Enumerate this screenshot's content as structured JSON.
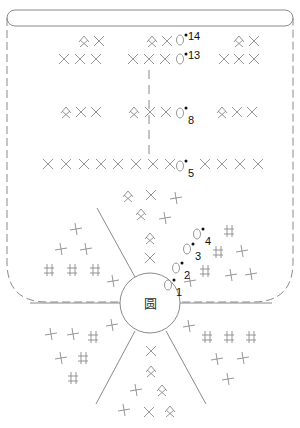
{
  "title": "",
  "center": {
    "label": "圆",
    "x": 150,
    "y": 303,
    "r": 30
  },
  "colors": {
    "line": "#8a8a8a",
    "dark_line": "#555555",
    "text": "#111111",
    "background": "#ffffff"
  },
  "outline": {
    "x": 7,
    "y": 10,
    "w": 286,
    "h": 292,
    "top_band_h": 16
  },
  "round_labels": [
    {
      "text": "14",
      "x": 184,
      "y": 40,
      "circle_x": 180,
      "circle_y": 40
    },
    {
      "text": "13",
      "x": 184,
      "y": 59,
      "circle_x": 180,
      "circle_y": 59
    },
    {
      "text": "8",
      "x": 184,
      "y": 118,
      "circle_x": 180,
      "circle_y": 113
    },
    {
      "text": "5",
      "x": 184,
      "y": 171,
      "circle_x": 180,
      "circle_y": 166
    },
    {
      "text": "4",
      "x": 201,
      "y": 239,
      "circle_x": 197,
      "circle_y": 234
    },
    {
      "text": "3",
      "x": 191,
      "y": 254,
      "circle_x": 187,
      "circle_y": 249
    },
    {
      "text": "2",
      "x": 180,
      "y": 273,
      "circle_x": 176,
      "circle_y": 268
    },
    {
      "text": "1",
      "x": 172,
      "y": 290,
      "circle_x": 168,
      "circle_y": 285
    }
  ],
  "symbols": [
    {
      "t": "kite",
      "x": 84,
      "y": 41
    },
    {
      "t": "x",
      "x": 99,
      "y": 41
    },
    {
      "t": "kite",
      "x": 152,
      "y": 41
    },
    {
      "t": "x",
      "x": 167,
      "y": 41
    },
    {
      "t": "kite",
      "x": 239,
      "y": 41
    },
    {
      "t": "x",
      "x": 254,
      "y": 41
    },
    {
      "t": "x",
      "x": 64,
      "y": 59
    },
    {
      "t": "x",
      "x": 80,
      "y": 59
    },
    {
      "t": "x",
      "x": 96,
      "y": 59
    },
    {
      "t": "x",
      "x": 133,
      "y": 59
    },
    {
      "t": "x",
      "x": 149,
      "y": 59
    },
    {
      "t": "x",
      "x": 165,
      "y": 59
    },
    {
      "t": "x",
      "x": 224,
      "y": 59
    },
    {
      "t": "x",
      "x": 239,
      "y": 59
    },
    {
      "t": "x",
      "x": 254,
      "y": 59
    },
    {
      "t": "kite",
      "x": 66,
      "y": 112
    },
    {
      "t": "x",
      "x": 81,
      "y": 112
    },
    {
      "t": "x",
      "x": 96,
      "y": 112
    },
    {
      "t": "kite",
      "x": 134,
      "y": 112
    },
    {
      "t": "x",
      "x": 150,
      "y": 112
    },
    {
      "t": "x",
      "x": 166,
      "y": 112
    },
    {
      "t": "kite",
      "x": 222,
      "y": 112
    },
    {
      "t": "x",
      "x": 237,
      "y": 112
    },
    {
      "t": "x",
      "x": 252,
      "y": 112
    },
    {
      "t": "x",
      "x": 48,
      "y": 164
    },
    {
      "t": "x",
      "x": 66,
      "y": 164
    },
    {
      "t": "x",
      "x": 84,
      "y": 164
    },
    {
      "t": "x",
      "x": 101,
      "y": 164
    },
    {
      "t": "x",
      "x": 118,
      "y": 164
    },
    {
      "t": "x",
      "x": 136,
      "y": 164
    },
    {
      "t": "x",
      "x": 153,
      "y": 164
    },
    {
      "t": "x",
      "x": 170,
      "y": 164
    },
    {
      "t": "x",
      "x": 205,
      "y": 164
    },
    {
      "t": "x",
      "x": 222,
      "y": 164
    },
    {
      "t": "x",
      "x": 240,
      "y": 164
    },
    {
      "t": "x",
      "x": 258,
      "y": 164
    },
    {
      "t": "kite",
      "x": 128,
      "y": 196
    },
    {
      "t": "x",
      "x": 151,
      "y": 195
    },
    {
      "t": "plus",
      "x": 176,
      "y": 198
    },
    {
      "t": "kite",
      "x": 141,
      "y": 214
    },
    {
      "t": "plus",
      "x": 165,
      "y": 218
    },
    {
      "t": "kite",
      "x": 150,
      "y": 238
    },
    {
      "t": "x",
      "x": 150,
      "y": 258
    },
    {
      "t": "plus",
      "x": 76,
      "y": 229
    },
    {
      "t": "plus",
      "x": 61,
      "y": 249
    },
    {
      "t": "plus",
      "x": 86,
      "y": 249
    },
    {
      "t": "gate",
      "x": 49,
      "y": 270
    },
    {
      "t": "gate",
      "x": 72,
      "y": 270
    },
    {
      "t": "gate",
      "x": 95,
      "y": 270
    },
    {
      "t": "plus",
      "x": 113,
      "y": 281
    },
    {
      "t": "gate",
      "x": 229,
      "y": 231
    },
    {
      "t": "gate",
      "x": 218,
      "y": 252
    },
    {
      "t": "plus",
      "x": 242,
      "y": 251
    },
    {
      "t": "gate",
      "x": 205,
      "y": 271
    },
    {
      "t": "plus",
      "x": 231,
      "y": 275
    },
    {
      "t": "plus",
      "x": 251,
      "y": 274
    },
    {
      "t": "plus",
      "x": 190,
      "y": 281
    },
    {
      "t": "plus",
      "x": 112,
      "y": 325
    },
    {
      "t": "plus",
      "x": 51,
      "y": 334
    },
    {
      "t": "plus",
      "x": 73,
      "y": 334
    },
    {
      "t": "gate",
      "x": 93,
      "y": 337
    },
    {
      "t": "plus",
      "x": 61,
      "y": 358
    },
    {
      "t": "gate",
      "x": 83,
      "y": 358
    },
    {
      "t": "gate",
      "x": 73,
      "y": 378
    },
    {
      "t": "plus",
      "x": 189,
      "y": 326
    },
    {
      "t": "gate",
      "x": 207,
      "y": 337
    },
    {
      "t": "gate",
      "x": 229,
      "y": 337
    },
    {
      "t": "gate",
      "x": 251,
      "y": 337
    },
    {
      "t": "plus",
      "x": 217,
      "y": 359
    },
    {
      "t": "plus",
      "x": 243,
      "y": 358
    },
    {
      "t": "plus",
      "x": 228,
      "y": 379
    },
    {
      "t": "x",
      "x": 151,
      "y": 351
    },
    {
      "t": "kite",
      "x": 151,
      "y": 371
    },
    {
      "t": "plus",
      "x": 136,
      "y": 390
    },
    {
      "t": "kite",
      "x": 162,
      "y": 390
    },
    {
      "t": "plus",
      "x": 124,
      "y": 410
    },
    {
      "t": "x",
      "x": 149,
      "y": 412
    },
    {
      "t": "kite",
      "x": 170,
      "y": 411
    }
  ]
}
